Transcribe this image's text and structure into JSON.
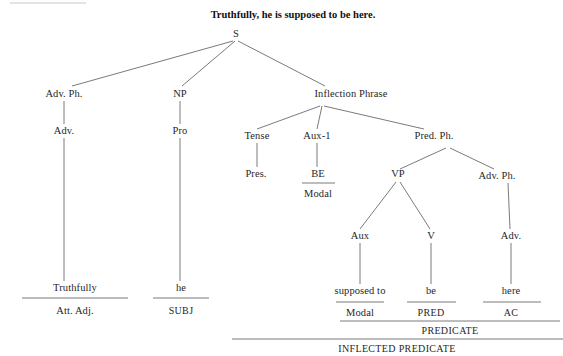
{
  "title": {
    "text": "Truthfully, he is supposed to be here."
  },
  "tree": {
    "nodes": [
      {
        "id": "s",
        "label": "S",
        "x": 236,
        "y": 34
      },
      {
        "id": "advph1",
        "label": "Adv. Ph.",
        "x": 64,
        "y": 94
      },
      {
        "id": "np",
        "label": "NP",
        "x": 180,
        "y": 94
      },
      {
        "id": "infl",
        "label": "Inflection Phrase",
        "x": 351,
        "y": 94
      },
      {
        "id": "adv1",
        "label": "Adv.",
        "x": 64,
        "y": 131
      },
      {
        "id": "pro",
        "label": "Pro",
        "x": 180,
        "y": 131
      },
      {
        "id": "tense",
        "label": "Tense",
        "x": 257,
        "y": 136
      },
      {
        "id": "aux1",
        "label": "Aux-1",
        "x": 317,
        "y": 136
      },
      {
        "id": "predph",
        "label": "Pred. Ph.",
        "x": 434,
        "y": 136
      },
      {
        "id": "pres",
        "label": "Pres.",
        "x": 256,
        "y": 174
      },
      {
        "id": "be",
        "label": "BE",
        "x": 318,
        "y": 174
      },
      {
        "id": "modal-upper",
        "label": "Modal",
        "x": 318,
        "y": 194
      },
      {
        "id": "vp",
        "label": "VP",
        "x": 398,
        "y": 174
      },
      {
        "id": "advph2",
        "label": "Adv. Ph.",
        "x": 497,
        "y": 176
      },
      {
        "id": "aux",
        "label": "Aux",
        "x": 360,
        "y": 236
      },
      {
        "id": "v",
        "label": "V",
        "x": 431,
        "y": 236
      },
      {
        "id": "adv2",
        "label": "Adv.",
        "x": 511,
        "y": 236
      },
      {
        "id": "word-truthfully",
        "label": "Truthfully",
        "x": 75,
        "y": 288
      },
      {
        "id": "word-he",
        "label": "he",
        "x": 181,
        "y": 288
      },
      {
        "id": "word-supposed",
        "label": "supposed to",
        "x": 360,
        "y": 291
      },
      {
        "id": "word-be",
        "label": "be",
        "x": 431,
        "y": 291
      },
      {
        "id": "word-here",
        "label": "here",
        "x": 511,
        "y": 291
      },
      {
        "id": "func-attadj",
        "label": "Att. Adj.",
        "x": 75,
        "y": 311
      },
      {
        "id": "func-subj",
        "label": "SUBJ",
        "x": 181,
        "y": 311
      },
      {
        "id": "func-modal",
        "label": "Modal",
        "x": 360,
        "y": 313
      },
      {
        "id": "func-pred",
        "label": "PRED",
        "x": 431,
        "y": 313
      },
      {
        "id": "func-ac",
        "label": "AC",
        "x": 511,
        "y": 313
      },
      {
        "id": "func-predicate",
        "label": "PREDICATE",
        "x": 450,
        "y": 331
      },
      {
        "id": "func-inflpred",
        "label": "INFLECTED PREDICATE",
        "x": 397,
        "y": 349
      }
    ],
    "edges": [
      {
        "from": "s",
        "to": "advph1",
        "x1": 233,
        "y1": 41,
        "x2": 72,
        "y2": 86
      },
      {
        "from": "s",
        "to": "np",
        "x1": 235,
        "y1": 41,
        "x2": 182,
        "y2": 86
      },
      {
        "from": "s",
        "to": "infl",
        "x1": 238,
        "y1": 41,
        "x2": 325,
        "y2": 86
      },
      {
        "from": "advph1",
        "to": "adv1",
        "x1": 64,
        "y1": 101,
        "x2": 64,
        "y2": 124
      },
      {
        "from": "np",
        "to": "pro",
        "x1": 180,
        "y1": 101,
        "x2": 180,
        "y2": 124
      },
      {
        "from": "infl",
        "to": "tense",
        "x1": 320,
        "y1": 106,
        "x2": 257,
        "y2": 129
      },
      {
        "from": "infl",
        "to": "aux1",
        "x1": 322,
        "y1": 106,
        "x2": 317,
        "y2": 129
      },
      {
        "from": "infl",
        "to": "predph",
        "x1": 324,
        "y1": 106,
        "x2": 424,
        "y2": 129
      },
      {
        "from": "adv1",
        "to": "word-truthfully",
        "x1": 64,
        "y1": 138,
        "x2": 64,
        "y2": 281
      },
      {
        "from": "pro",
        "to": "word-he",
        "x1": 180,
        "y1": 138,
        "x2": 180,
        "y2": 281
      },
      {
        "from": "tense",
        "to": "pres",
        "x1": 257,
        "y1": 143,
        "x2": 257,
        "y2": 167
      },
      {
        "from": "aux1",
        "to": "be",
        "x1": 317,
        "y1": 143,
        "x2": 317,
        "y2": 167
      },
      {
        "from": "predph",
        "to": "vp",
        "x1": 446,
        "y1": 148,
        "x2": 400,
        "y2": 169
      },
      {
        "from": "predph",
        "to": "advph2",
        "x1": 450,
        "y1": 148,
        "x2": 494,
        "y2": 169
      },
      {
        "from": "vp",
        "to": "aux",
        "x1": 396,
        "y1": 182,
        "x2": 360,
        "y2": 229
      },
      {
        "from": "vp",
        "to": "v",
        "x1": 400,
        "y1": 182,
        "x2": 430,
        "y2": 229
      },
      {
        "from": "advph2",
        "to": "adv2",
        "x1": 508,
        "y1": 183,
        "x2": 510,
        "y2": 229
      },
      {
        "from": "aux",
        "to": "word-supposed",
        "x1": 360,
        "y1": 243,
        "x2": 360,
        "y2": 284
      },
      {
        "from": "v",
        "to": "word-be",
        "x1": 431,
        "y1": 243,
        "x2": 431,
        "y2": 284
      },
      {
        "from": "adv2",
        "to": "word-here",
        "x1": 511,
        "y1": 243,
        "x2": 511,
        "y2": 284
      }
    ],
    "rules": [
      {
        "id": "rule-be",
        "x1": 302,
        "x2": 335,
        "y": 183
      },
      {
        "id": "rule-truthfully",
        "x1": 22,
        "x2": 128,
        "y": 298
      },
      {
        "id": "rule-he",
        "x1": 153,
        "x2": 209,
        "y": 298
      },
      {
        "id": "rule-supposed",
        "x1": 336,
        "x2": 384,
        "y": 302
      },
      {
        "id": "rule-be-word",
        "x1": 407,
        "x2": 456,
        "y": 302
      },
      {
        "id": "rule-here",
        "x1": 483,
        "x2": 541,
        "y": 302
      },
      {
        "id": "rule-predicate",
        "x1": 340,
        "x2": 560,
        "y": 321
      },
      {
        "id": "rule-inflected",
        "x1": 232,
        "x2": 563,
        "y": 339
      }
    ],
    "faint_rules": [
      {
        "id": "rule-top-margin",
        "x1": 10,
        "x2": 86,
        "y": 3
      }
    ]
  }
}
